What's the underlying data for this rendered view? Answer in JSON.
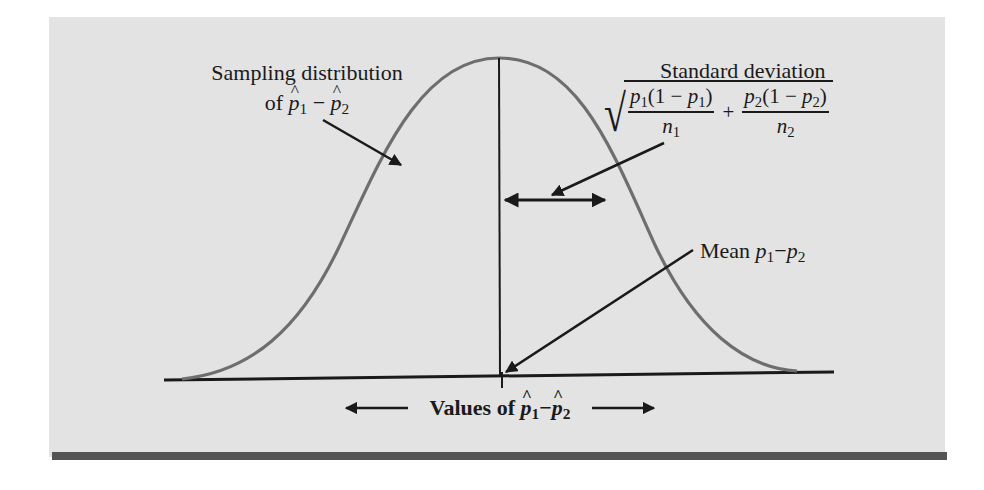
{
  "figure": {
    "sampling_label": {
      "line1": "Sampling distribution",
      "line2_prefix": "of",
      "line2_expr": {
        "a": "p",
        "a_sub": "1",
        "op": "−",
        "b": "p",
        "b_sub": "2",
        "hats": true
      }
    },
    "sd_label": {
      "title": "Standard deviation",
      "formula": {
        "term1_num": {
          "p": "p",
          "sub": "1",
          "paren_open": "(1 − ",
          "p2": "p",
          "sub2": "1",
          "paren_close": ")"
        },
        "term1_den": {
          "n": "n",
          "sub": "1"
        },
        "plus": "+",
        "term2_num": {
          "p": "p",
          "sub": "2",
          "paren_open": "(1 − ",
          "p2": "p",
          "sub2": "2",
          "paren_close": ")"
        },
        "term2_den": {
          "n": "n",
          "sub": "2"
        }
      }
    },
    "mean_label": {
      "prefix": "Mean",
      "a": "p",
      "a_sub": "1",
      "op": "−",
      "b": "p",
      "b_sub": "2"
    },
    "axis_label": {
      "prefix": "Values of",
      "a": "p",
      "a_sub": "1",
      "op": "−",
      "b": "p",
      "b_sub": "2",
      "hats": true
    },
    "colors": {
      "panel": "#e3e3e3",
      "curve": "#6e6e6e",
      "ink": "#1a1a1a",
      "bottom_bar": "#545454"
    }
  }
}
